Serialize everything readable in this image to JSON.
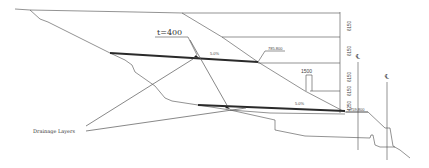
{
  "diagram": {
    "type": "slope cross-section",
    "labels": {
      "thickness": "t=400",
      "drainage": "Drainage Layers",
      "slope_upper": "5.0%",
      "slope_lower": "5.0%",
      "elev_upper": "785.800",
      "elev_lower": "759.800",
      "berm_width": "1500",
      "centerline_1": "℄",
      "centerline_2": "℄"
    },
    "dimensions": [
      "6150",
      "6150",
      "6150",
      "6150",
      "4250"
    ]
  }
}
